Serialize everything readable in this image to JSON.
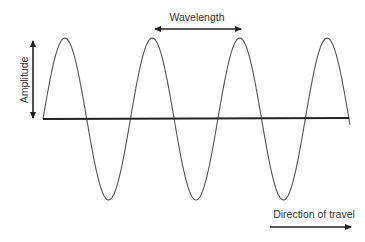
{
  "diagram": {
    "type": "transverse-wave",
    "cycles_shown": 3.5,
    "labels": {
      "wavelength": "Wavelength",
      "amplitude": "Amplitude",
      "direction": "Direction of travel"
    },
    "colors": {
      "wave": "#555555",
      "axis": "#222222",
      "arrows": "#222222",
      "text": "#333333",
      "background": "#ffffff"
    }
  }
}
